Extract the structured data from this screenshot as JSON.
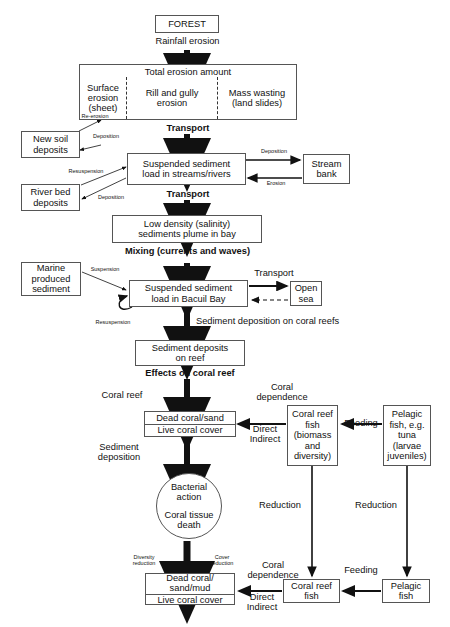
{
  "diagram": {
    "nodes": {
      "forest": "FOREST",
      "total_erosion_header": "Total erosion amount",
      "surface_erosion": "Surface\nerosion\n(sheet)",
      "rill_gully": "Rill and gully\nerosion",
      "mass_wasting": "Mass wasting\n(land slides)",
      "new_soil": "New soil\ndeposits",
      "river_bed": "River bed\ndeposits",
      "susp_streams": "Suspended sediment\nload in streams/rivers",
      "stream_bank": "Stream\nbank",
      "low_density": "Low density (salinity)\nsediments plume in bay",
      "marine_sediment": "Marine\nproduced\nsediment",
      "susp_bay": "Suspended sediment\nload in Bacuil Bay",
      "open_sea": "Open\nsea",
      "sediment_deposits_reef": "Sediment deposits\non reef",
      "dead_coral_sand": "Dead coral/sand",
      "live_coral_cover_1": "Live coral cover",
      "bacterial_action": "Bacterial\naction",
      "coral_tissue_death": "Coral tissue\ndeath",
      "coral_reef_fish_biomass": "Coral reef\nfish\n(biomass\nand\ndiversity)",
      "pelagic_fish_tuna": "Pelagic\nfish, e.g.\ntuna\n(larvae\njuveniles)",
      "dead_coral_sand_mud": "Dead coral/\nsand/mud",
      "live_coral_cover_2": "Live coral cover",
      "coral_reef_fish_2": "Coral reef\nfish",
      "pelagic_fish_2": "Pelagic\nfish"
    },
    "edge_labels": {
      "rainfall_erosion": "Rainfall erosion",
      "transport_1": "Transport",
      "transport_2": "Transport",
      "re_erosion": "Re-erosion",
      "deposition_newsoil": "Deposition",
      "deposition_stream": "Deposition",
      "erosion_streambank": "Erosion",
      "resuspension_riverbed": "Resuspension",
      "deposition_riverbed": "Deposition",
      "mixing": "Mixing (currents and waves)",
      "suspension_marine": "Suspension",
      "transport_3": "Transport",
      "resuspension_bay": "Resuspension",
      "sediment_deposition_reefs": "Sediment deposition on coral reefs",
      "effects_on_coral_reef": "Effects on coral reef",
      "coral_reef_left": "Coral reef",
      "coral_dependence_1": "Coral\ndependence",
      "feeding_1": "Feeding",
      "direct_indirect_1": "Direct\nIndirect",
      "sediment_deposition_left": "Sediment\ndeposition",
      "reduction_1": "Reduction",
      "reduction_2": "Reduction",
      "diversity_reduction": "Diversity\nreduction",
      "cover_reduction": "Cover\nreduction",
      "coral_dependence_2": "Coral\ndependence",
      "feeding_2": "Feeding",
      "direct_indirect_2": "Direct\nIndirect"
    },
    "colors": {
      "box_border": "#555555",
      "arrow": "#111111",
      "background": "#ffffff"
    }
  }
}
